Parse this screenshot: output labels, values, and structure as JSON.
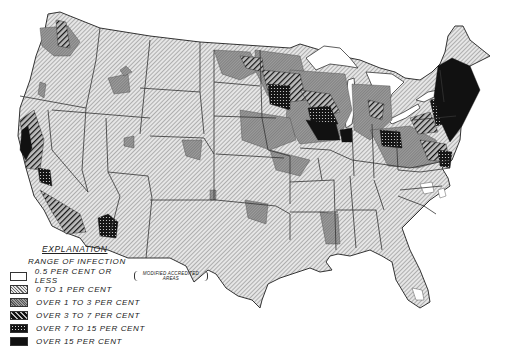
{
  "map": {
    "subject": "United States",
    "style": "black-and-white hatched choropleth",
    "colors": {
      "background": "#ffffff",
      "outline": "#333333",
      "hatch": "#555555",
      "dark": "#111111"
    }
  },
  "legend": {
    "title": "EXPLANATION",
    "subtitle": "RANGE OF INFECTION",
    "items": [
      {
        "label": "0.5 PER CENT OR LESS",
        "note": "MODIFIED ACCREDITED AREAS",
        "pattern": "blank"
      },
      {
        "label": "0 TO 1 PER CENT",
        "pattern": "light-hatch"
      },
      {
        "label": "OVER 1 TO 3 PER CENT",
        "pattern": "dense-stipple"
      },
      {
        "label": "OVER 3 TO 7 PER CENT",
        "pattern": "heavy-hatch"
      },
      {
        "label": "OVER 7 TO 15 PER CENT",
        "pattern": "dotted-black"
      },
      {
        "label": "OVER 15 PER CENT",
        "pattern": "solid-black"
      }
    ]
  }
}
